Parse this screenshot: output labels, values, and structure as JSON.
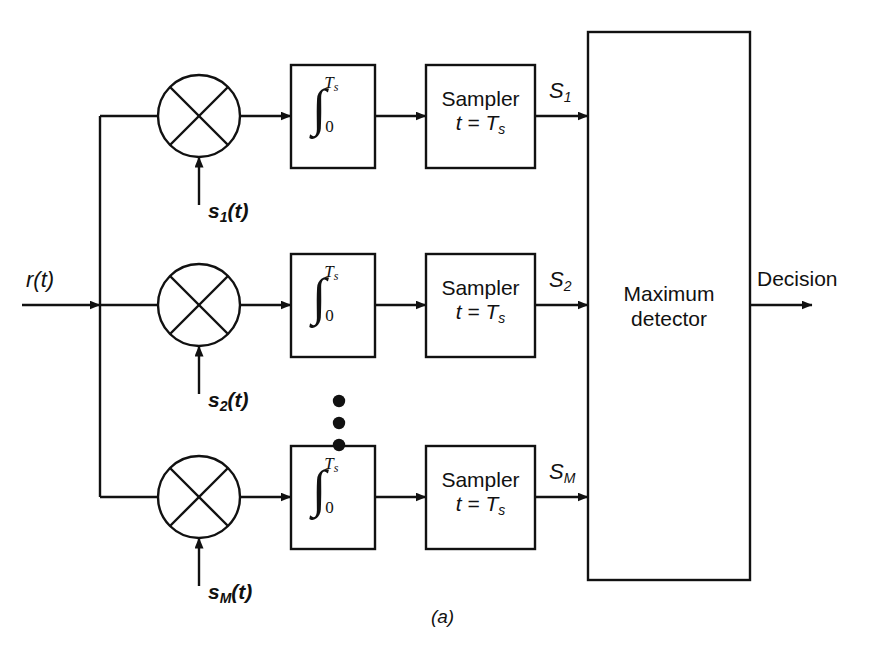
{
  "figure": {
    "caption": "(a)",
    "input_signal": "r(t)",
    "output_signal": "Decision"
  },
  "detector": {
    "line1": "Maximum",
    "line2": "detector"
  },
  "branches": [
    {
      "id": "branch-1",
      "reference_signal_base": "s",
      "reference_signal_sub": "1",
      "reference_signal_tail": "(t)",
      "integrator": {
        "symbol": "∫",
        "upper_limit_base": "T",
        "upper_limit_sub": "s",
        "lower_limit": "0"
      },
      "sampler": {
        "line1": "Sampler",
        "line2_lhs": "t = T",
        "line2_sub": "s"
      },
      "output_base": "S",
      "output_sub": "1"
    },
    {
      "id": "branch-2",
      "reference_signal_base": "s",
      "reference_signal_sub": "2",
      "reference_signal_tail": "(t)",
      "integrator": {
        "symbol": "∫",
        "upper_limit_base": "T",
        "upper_limit_sub": "s",
        "lower_limit": "0"
      },
      "sampler": {
        "line1": "Sampler",
        "line2_lhs": "t = T",
        "line2_sub": "s"
      },
      "output_base": "S",
      "output_sub": "2"
    },
    {
      "id": "branch-M",
      "reference_signal_base": "s",
      "reference_signal_sub": "M",
      "reference_signal_tail": "(t)",
      "integrator": {
        "symbol": "∫",
        "upper_limit_base": "T",
        "upper_limit_sub": "s",
        "lower_limit": "0"
      },
      "sampler": {
        "line1": "Sampler",
        "line2_lhs": "t = T",
        "line2_sub": "s"
      },
      "output_base": "S",
      "output_sub": "M"
    }
  ],
  "ellipsis": "⋮",
  "colors": {
    "line": "#111111",
    "text": "#111111",
    "background": "#ffffff"
  }
}
